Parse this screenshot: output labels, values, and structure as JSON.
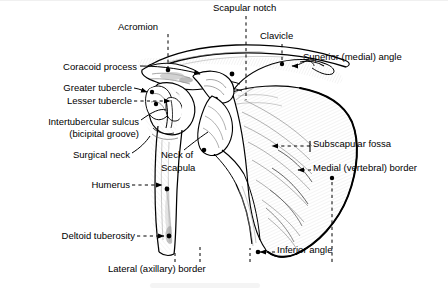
{
  "figure": {
    "view": "anterior",
    "style": "black-and-white line drawing with leader lines",
    "background_color": "#ffffff",
    "line_color": "#000000",
    "text_color": "#000000"
  },
  "labels": [
    {
      "id": "acromion",
      "text": "Acromion",
      "x": 118,
      "y": 27,
      "align": "left",
      "leader": "dashed-vertical"
    },
    {
      "id": "scapular-notch",
      "text": "Scapular notch",
      "x": 213,
      "y": 8,
      "align": "left",
      "leader": "dashed-vertical"
    },
    {
      "id": "clavicle",
      "text": "Clavicle",
      "x": 260,
      "y": 36,
      "align": "left",
      "leader": "dashed-vertical"
    },
    {
      "id": "superior-medial-angle",
      "text": "Superior (medial) angle",
      "x": 303,
      "y": 57,
      "align": "left",
      "leader": "solid-arrow"
    },
    {
      "id": "coracoid-process",
      "text": "Coracoid process",
      "x": 135,
      "y": 67,
      "align": "right",
      "leader": "solid-arrow"
    },
    {
      "id": "greater-tubercle",
      "text": "Greater tubercle",
      "x": 130,
      "y": 86,
      "align": "right",
      "leader": "solid-arrow"
    },
    {
      "id": "lesser-tubercle",
      "text": "Lesser tubercle",
      "x": 130,
      "y": 99,
      "align": "right",
      "leader": "dashed-arrow"
    },
    {
      "id": "intertubercular-sulcus",
      "text": "Intertubercular sulcus",
      "x": 137,
      "y": 121,
      "align": "right",
      "leader": "solid-line"
    },
    {
      "id": "bicipital-groove",
      "text": "(bicipital groove)",
      "x": 137,
      "y": 133,
      "align": "right",
      "leader": "none"
    },
    {
      "id": "surgical-neck",
      "text": "Surgical neck",
      "x": 128,
      "y": 155,
      "align": "right",
      "leader": "solid-line"
    },
    {
      "id": "neck-of-scapula-1",
      "text": "Neck of",
      "x": 161,
      "y": 155,
      "align": "left",
      "leader": "solid-line"
    },
    {
      "id": "neck-of-scapula-2",
      "text": "Scapula",
      "x": 161,
      "y": 168,
      "align": "left",
      "leader": "none"
    },
    {
      "id": "humerus",
      "text": "Humerus",
      "x": 128,
      "y": 183,
      "align": "right",
      "leader": "dashed-arrow"
    },
    {
      "id": "subscapular-fossa",
      "text": "Subscapular fossa",
      "x": 313,
      "y": 143,
      "align": "left",
      "leader": "dashed-arrow-left"
    },
    {
      "id": "medial-vertebral-border",
      "text": "Medial (vertebral) border",
      "x": 313,
      "y": 167,
      "align": "left",
      "leader": "dashed-arrow-left"
    },
    {
      "id": "deltoid-tuberosity",
      "text": "Deltoid tuberosity",
      "x": 133,
      "y": 234,
      "align": "right",
      "leader": "dashed-arrow"
    },
    {
      "id": "inferior-angle",
      "text": "Inferior angle",
      "x": 277,
      "y": 249,
      "align": "left",
      "leader": "dashed-arrow-left"
    },
    {
      "id": "lateral-axillary-border",
      "text": "Lateral (axillary) border",
      "x": 108,
      "y": 268,
      "align": "left",
      "leader": "dashed-vertical-up"
    }
  ],
  "structures": [
    "clavicle",
    "acromion",
    "coracoid process",
    "scapular notch",
    "superior (medial) angle",
    "subscapular fossa",
    "medial (vertebral) border",
    "lateral (axillary) border",
    "inferior angle",
    "neck of scapula",
    "humerus",
    "greater tubercle",
    "lesser tubercle",
    "intertubercular sulcus (bicipital groove)",
    "surgical neck",
    "deltoid tuberosity"
  ]
}
